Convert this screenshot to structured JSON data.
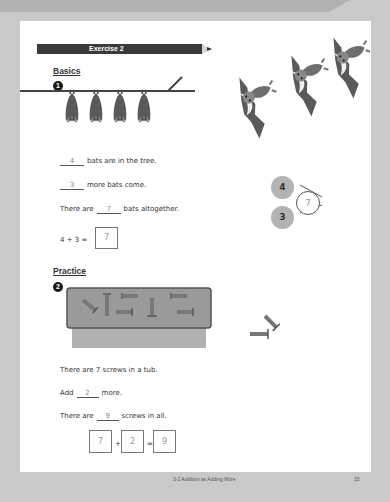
{
  "header": {
    "banner_title": "Exercise pages",
    "exercise_label": "Exercise 2"
  },
  "basics": {
    "heading": "Basics",
    "problem_number": "1",
    "line1": {
      "answer": "4",
      "text": "bats are in the tree."
    },
    "line2": {
      "answer": "3",
      "text": "more bats come."
    },
    "line3": {
      "prefix": "There are",
      "answer": "7",
      "suffix": "bats altogether."
    },
    "equation": {
      "expression": "4 + 3 =",
      "answer": "7"
    },
    "number_bond": {
      "part1": "4",
      "part2": "3",
      "whole": "7"
    },
    "hanging_bats_count": 4,
    "flying_bats_count": 3
  },
  "practice": {
    "heading": "Practice",
    "problem_number": "2",
    "line1": {
      "text": "There are 7 screws in a tub."
    },
    "line2": {
      "prefix": "Add",
      "answer": "2",
      "suffix": "more."
    },
    "line3": {
      "prefix": "There are",
      "answer": "9",
      "suffix": "screws in all."
    },
    "equation": {
      "a": "7",
      "op1": "+",
      "b": "2",
      "op2": "=",
      "result": "9"
    },
    "screws_in_tub": 7,
    "screws_outside": 2
  },
  "footer": {
    "lesson": "3-2 Addition as Adding More",
    "page_number": "33"
  },
  "colors": {
    "page_bg": "#ffffff",
    "surround": "#c9c9c9",
    "bat": "#5a5a5a",
    "bond_filled": "#b3b3b3",
    "tub": "#8d8d8d"
  }
}
